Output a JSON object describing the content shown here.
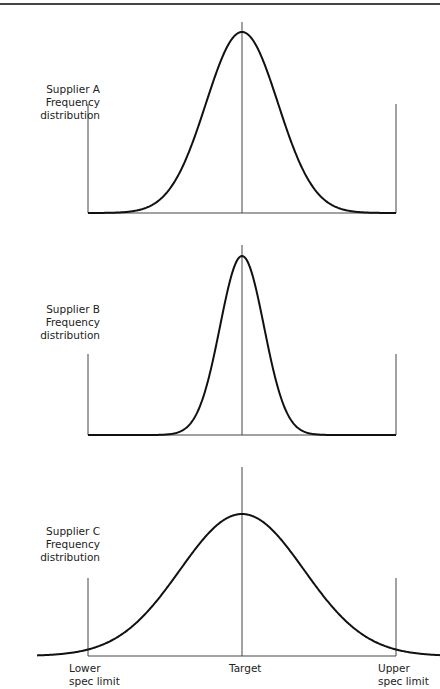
{
  "figure": {
    "panels": [
      {
        "name": "Supplier A",
        "label_line1": "Supplier A",
        "label_line2": "Frequency distribution",
        "shape": "normal",
        "spread": "medium"
      },
      {
        "name": "Supplier B",
        "label_line1": "Supplier B",
        "label_line2": "Frequency distribution",
        "shape": "normal",
        "spread": "narrow"
      },
      {
        "name": "Supplier C",
        "label_line1": "Supplier C",
        "label_line2": "Frequency distribution",
        "shape": "normal",
        "spread": "wide"
      }
    ],
    "axis_labels": {
      "lower_line1": "Lower",
      "lower_line2": "spec limit",
      "target": "Target",
      "upper_line1": "Upper",
      "upper_line2": "spec limit"
    },
    "colors": {
      "line": "#111111",
      "axis": "#333333"
    }
  }
}
